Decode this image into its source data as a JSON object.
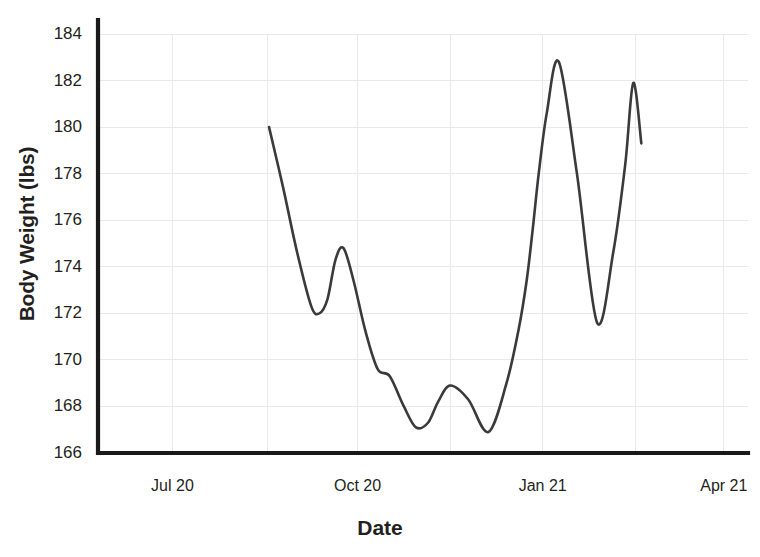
{
  "chart_data": {
    "type": "line",
    "title": "",
    "xlabel": "Date",
    "ylabel": "Body Weight (lbs)",
    "grid": true,
    "legend": "none",
    "ylim": [
      166,
      184
    ],
    "yticks": [
      166,
      168,
      170,
      172,
      174,
      176,
      178,
      180,
      182,
      184
    ],
    "ytick_labels": [
      "166",
      "168",
      "170",
      "172",
      "174",
      "176",
      "178",
      "180",
      "182",
      "184"
    ],
    "xticks": [
      "Jul 20",
      "Oct 20",
      "Jan 21",
      "Apr 21"
    ],
    "xtick_labels": [
      "Jul 20",
      "Oct 20",
      "Jan 21",
      "Apr 21"
    ],
    "line_color": "#3a3a3c",
    "grid_color": "#e9e9ec",
    "axis_color": "#1a1a1a",
    "background_color": "#ffffff",
    "series": [
      {
        "name": "Body Weight",
        "x": [
          "2020-09-06",
          "2020-09-13",
          "2020-09-20",
          "2020-09-27",
          "2020-10-01",
          "2020-10-05",
          "2020-10-09",
          "2020-10-13",
          "2020-10-18",
          "2020-10-24",
          "2020-10-30",
          "2020-11-05",
          "2020-11-12",
          "2020-11-18",
          "2020-11-24",
          "2020-11-29",
          "2020-12-05",
          "2020-12-14",
          "2020-12-24",
          "2021-01-02",
          "2021-01-08",
          "2021-01-12",
          "2021-01-15",
          "2021-01-18",
          "2021-01-22",
          "2021-01-28",
          "2021-02-06",
          "2021-02-16",
          "2021-02-24",
          "2021-03-02",
          "2021-03-06",
          "2021-03-10"
        ],
        "values": [
          180.0,
          177.4,
          174.6,
          172.3,
          172.0,
          172.6,
          174.3,
          174.8,
          173.4,
          171.2,
          169.6,
          169.3,
          168.0,
          167.1,
          167.3,
          168.2,
          168.9,
          168.3,
          166.9,
          169.0,
          171.3,
          173.4,
          175.6,
          178.0,
          180.6,
          182.8,
          178.0,
          171.6,
          174.6,
          178.4,
          181.9,
          179.3
        ],
        "start_value": 180.0,
        "end_value": 179.3,
        "min_value": 166.9,
        "max_value": 182.8,
        "min_label": "166.9",
        "max_label": "182.8"
      }
    ]
  }
}
